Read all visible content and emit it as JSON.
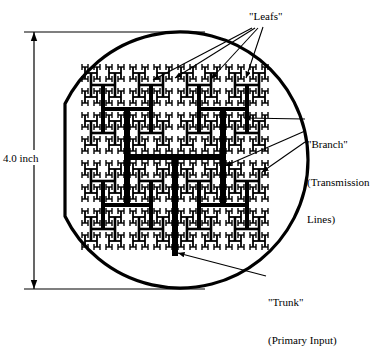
{
  "figure": {
    "type": "diagram",
    "shape": "circular substrate with recursive H-tree transmission line",
    "colors": {
      "ink": "#000000",
      "background": "#ffffff"
    },
    "substrate": {
      "name": "circular-substrate",
      "cx": 180,
      "cy": 160,
      "r": 128,
      "stroke_width": 3.2,
      "flat_left_edge": true
    },
    "dimension": {
      "name": "overall-height",
      "value": "4.0 inch",
      "x": 34,
      "y_top": 32,
      "y_bottom": 289
    },
    "htree": {
      "levels": 4,
      "root_x": 175,
      "root_y": 157,
      "root_half_width": 48,
      "root_half_height": 48,
      "trunk_bottom_y": 256,
      "stroke_widths": [
        6.0,
        4.0,
        2.6,
        1.8,
        1.4
      ]
    }
  },
  "labels": {
    "leafs": "\"Leafs\"",
    "branch_line1": "\"Branch\"",
    "branch_line2": "(Transmission",
    "branch_line3": "Lines)",
    "trunk_line1": "\"Trunk\"",
    "trunk_line2": "(Primary Input)",
    "dimension": "4.0 inch"
  },
  "leaders": {
    "leafs_arrows": [
      {
        "from_x": 252,
        "from_y": 28,
        "to_x": 153,
        "to_y": 80
      },
      {
        "from_x": 255,
        "from_y": 28,
        "to_x": 175,
        "to_y": 78
      },
      {
        "from_x": 258,
        "from_y": 28,
        "to_x": 211,
        "to_y": 79
      },
      {
        "from_x": 263,
        "from_y": 27,
        "to_x": 246,
        "to_y": 78
      }
    ],
    "branch_arrows": [
      {
        "from_x": 305,
        "from_y": 119,
        "to_x": 244,
        "to_y": 118
      },
      {
        "from_x": 305,
        "from_y": 131,
        "to_x": 225,
        "to_y": 166
      },
      {
        "from_x": 305,
        "from_y": 142,
        "to_x": 262,
        "to_y": 172
      }
    ],
    "trunk_arrow": {
      "from_x": 266,
      "from_y": 276,
      "to_x": 178,
      "to_y": 253
    }
  }
}
